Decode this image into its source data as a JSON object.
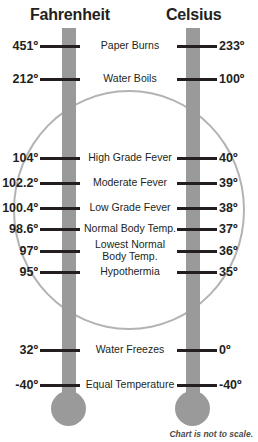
{
  "chart_data": {
    "type": "table",
    "footnote": "Chart is not to scale.",
    "columns": [
      "Fahrenheit",
      "Description",
      "Celsius"
    ],
    "scales": [
      {
        "name": "Fahrenheit",
        "unit": "°F",
        "side": "left"
      },
      {
        "name": "Celsius",
        "unit": "°C",
        "side": "right"
      }
    ],
    "grid": false,
    "legend": "none",
    "rows": [
      {
        "fahrenheit": "451º",
        "celsius": "233º",
        "label": "Paper Burns",
        "f_value": 451,
        "c_value": 233,
        "y": 46
      },
      {
        "fahrenheit": "212º",
        "celsius": "100º",
        "label": "Water Boils",
        "f_value": 212,
        "c_value": 100,
        "y": 79
      },
      {
        "fahrenheit": "104º",
        "celsius": "40º",
        "label": "High Grade Fever",
        "f_value": 104,
        "c_value": 40,
        "y": 158
      },
      {
        "fahrenheit": "102.2º",
        "celsius": "39º",
        "label": "Moderate Fever",
        "f_value": 102.2,
        "c_value": 39,
        "y": 183
      },
      {
        "fahrenheit": "100.4º",
        "celsius": "38º",
        "label": "Low Grade Fever",
        "f_value": 100.4,
        "c_value": 38,
        "y": 208
      },
      {
        "fahrenheit": "98.6º",
        "celsius": "37º",
        "label": "Normal Body Temp.",
        "f_value": 98.6,
        "c_value": 37,
        "y": 229
      },
      {
        "fahrenheit": "97º",
        "celsius": "36º",
        "label": "Lowest Normal\nBody Temp.",
        "f_value": 97,
        "c_value": 36,
        "y": 251
      },
      {
        "fahrenheit": "95º",
        "celsius": "35º",
        "label": "Hypothermia",
        "f_value": 95,
        "c_value": 35,
        "y": 272
      },
      {
        "fahrenheit": "32º",
        "celsius": "0º",
        "label": "Water Freezes",
        "f_value": 32,
        "c_value": 0,
        "y": 350
      },
      {
        "fahrenheit": "-40º",
        "celsius": "-40º",
        "label": "Equal Temperature",
        "f_value": -40,
        "c_value": -40,
        "y": 385
      }
    ],
    "colors": {
      "tube": "#9a9a9a",
      "ellipse": "#b3b3b3",
      "text": "#231f20",
      "footnote": "#4d4d4d"
    }
  },
  "headers": {
    "fahrenheit": "Fahrenheit",
    "celsius": "Celsius"
  },
  "footnote": "Chart is not to scale."
}
